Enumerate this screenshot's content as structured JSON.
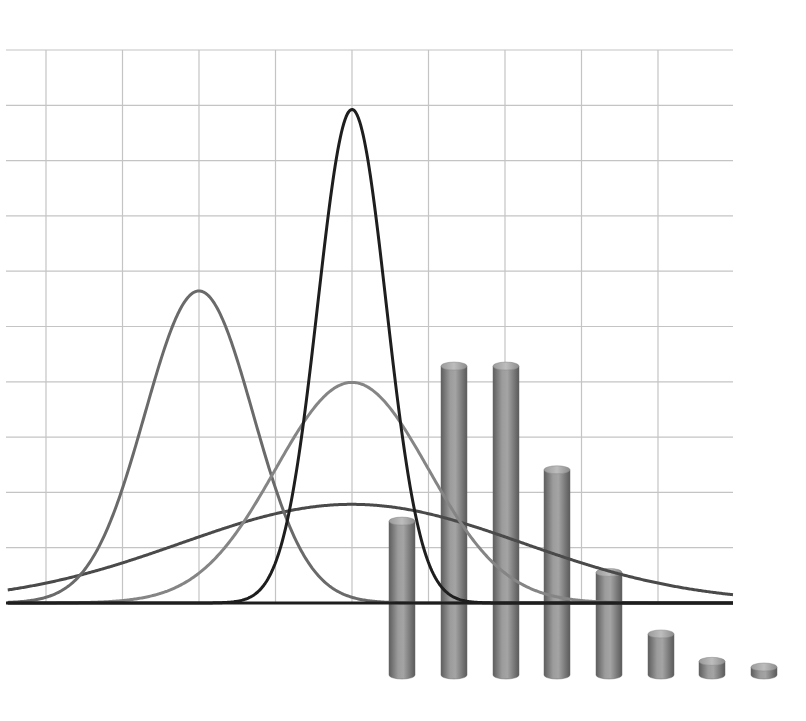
{
  "chart_data": [
    {
      "type": "line",
      "title": "",
      "xlabel": "",
      "ylabel": "",
      "xlim": [
        -4.5,
        5.0
      ],
      "ylim": [
        0,
        1.0
      ],
      "grid": true,
      "x_gridlines": [
        -4,
        -3,
        -2,
        -1,
        0,
        1,
        2,
        3,
        4
      ],
      "y_gridlines": [
        0,
        0.1,
        0.2,
        0.3,
        0.4,
        0.5,
        0.6,
        0.7,
        0.8,
        0.9,
        1.0
      ],
      "legend": null,
      "series": [
        {
          "name": "normal mu=0 sigma2=0.2",
          "mu": 0,
          "sigma": 0.447,
          "peak": 0.892,
          "color": "#1e1e1e"
        },
        {
          "name": "normal mu=0 sigma2=1",
          "mu": 0,
          "sigma": 1.0,
          "peak": 0.399,
          "color": "#858585"
        },
        {
          "name": "normal mu=0 sigma2=5",
          "mu": 0,
          "sigma": 2.236,
          "peak": 0.178,
          "color": "#4a4a4a"
        },
        {
          "name": "normal mu=-2 sigma2=0.5",
          "mu": -2,
          "sigma": 0.707,
          "peak": 0.564,
          "color": "#6a6a6a"
        }
      ]
    },
    {
      "type": "bar",
      "style": "3d-cylinder",
      "title": "",
      "categories": [
        "0",
        "1",
        "2",
        "3",
        "4",
        "5",
        "6",
        "7"
      ],
      "values": [
        0.135,
        0.271,
        0.271,
        0.18,
        0.09,
        0.036,
        0.012,
        0.007
      ],
      "color": "#8a8a8a",
      "tick_labels_visible": false
    }
  ],
  "layout": {
    "plot": {
      "left": 6,
      "right": 733,
      "top": 50,
      "bottom": 603,
      "x_zero_px": 352,
      "px_per_x_unit": 76.5,
      "px_per_y_unit": 553
    },
    "bars": {
      "x_starts": [
        389,
        441,
        493,
        544,
        596,
        648,
        699,
        751
      ],
      "width": 26,
      "bottom": 675,
      "px_per_value": 1140
    }
  }
}
